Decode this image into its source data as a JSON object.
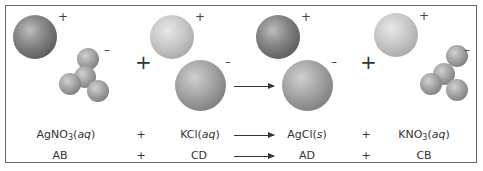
{
  "reaction": {
    "reactant1": {
      "formula_main": "AgNO",
      "formula_sub": "3",
      "state": "aq",
      "generic": "AB"
    },
    "reactant2": {
      "formula_main": "KCl",
      "formula_sub": "",
      "state": "aq",
      "generic": "CD"
    },
    "product1": {
      "formula_main": "AgCl",
      "formula_sub": "",
      "state": "s",
      "generic": "AD"
    },
    "product2": {
      "formula_main": "KNO",
      "formula_sub": "3",
      "state": "aq",
      "generic": "CB"
    }
  },
  "symbols": {
    "plus": "+",
    "minus": "–",
    "open_paren": "(",
    "close_paren": ")"
  },
  "colors": {
    "border": "#666666",
    "text": "#333333"
  }
}
